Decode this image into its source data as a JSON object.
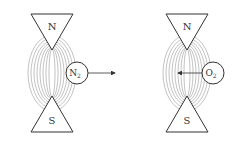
{
  "diagram": {
    "left": {
      "north_label": "N",
      "south_label": "S",
      "molecule": "N",
      "molecule_sub": "2",
      "arrow_direction": "out of field (right)"
    },
    "right": {
      "north_label": "N",
      "south_label": "S",
      "molecule": "O",
      "molecule_sub": "2",
      "arrow_direction": "into field (left)"
    },
    "colors": {
      "line": "#333333",
      "field": "#888888",
      "background": "#ffffff"
    }
  }
}
